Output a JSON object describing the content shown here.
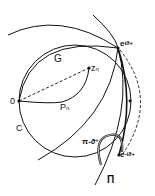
{
  "labels": {
    "G": "G",
    "zn": "z",
    "zn_sub": "n",
    "O": "0",
    "Pn": "P",
    "Pn_sub": "n",
    "C": "C",
    "e_plus": "e",
    "e_plus_sup": "iϑ+",
    "e_minus": "e",
    "e_minus_sup": "-iϑ+",
    "angle": "π-ϑ",
    "angle_sup": "+",
    "Pi": "Π"
  },
  "colors": {
    "ink": "#111111",
    "background": "#ffffff"
  }
}
